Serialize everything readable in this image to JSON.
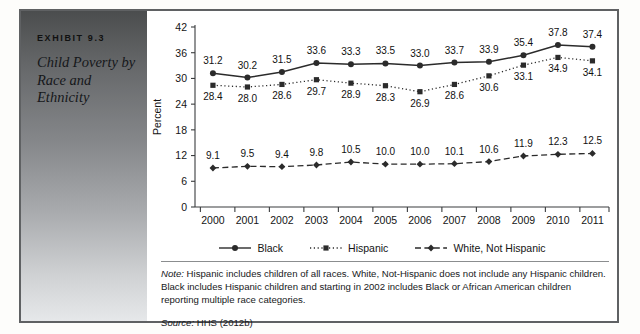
{
  "exhibit": {
    "label": "EXHIBIT 9.3",
    "title": "Child Poverty by Race and Ethnicity"
  },
  "notes": {
    "note_prefix": "Note:",
    "note_body": " Hispanic includes children of all races. White, Not-Hispanic does not include any Hispanic children. Black includes Hispanic children and starting in 2002 includes Black or African American children reporting multiple race categories.",
    "source_prefix": "Source:",
    "source_body": " HHS (2012b)"
  },
  "chart_data": {
    "type": "line",
    "title": "",
    "xlabel": "",
    "ylabel": "Percent",
    "x": [
      "2000",
      "2001",
      "2002",
      "2003",
      "2004",
      "2005",
      "2006",
      "2007",
      "2008",
      "2009",
      "2010",
      "2011"
    ],
    "categories": [
      "2000",
      "2001",
      "2002",
      "2003",
      "2004",
      "2005",
      "2006",
      "2007",
      "2008",
      "2009",
      "2010",
      "2011"
    ],
    "ylim": [
      0,
      42
    ],
    "yticks": [
      0,
      6,
      12,
      18,
      24,
      30,
      36,
      42
    ],
    "grid": false,
    "legend_position": "bottom",
    "series": [
      {
        "name": "Black",
        "line_style": "solid",
        "marker": "circle",
        "color": "#2b2b2b",
        "label_position": "above",
        "values": [
          31.2,
          30.2,
          31.5,
          33.6,
          33.3,
          33.5,
          33.0,
          33.7,
          33.9,
          35.4,
          37.8,
          37.4
        ]
      },
      {
        "name": "Hispanic",
        "line_style": "dotted",
        "marker": "square",
        "color": "#2b2b2b",
        "label_position": "below",
        "values": [
          28.4,
          28.0,
          28.6,
          29.7,
          28.9,
          28.3,
          26.9,
          28.6,
          30.6,
          33.1,
          34.9,
          34.1
        ]
      },
      {
        "name": "White, Not Hispanic",
        "line_style": "dashed",
        "marker": "diamond",
        "color": "#2b2b2b",
        "label_position": "above",
        "values": [
          9.1,
          9.5,
          9.4,
          9.8,
          10.5,
          10.0,
          10.0,
          10.1,
          10.6,
          11.9,
          12.3,
          12.5
        ]
      }
    ]
  }
}
